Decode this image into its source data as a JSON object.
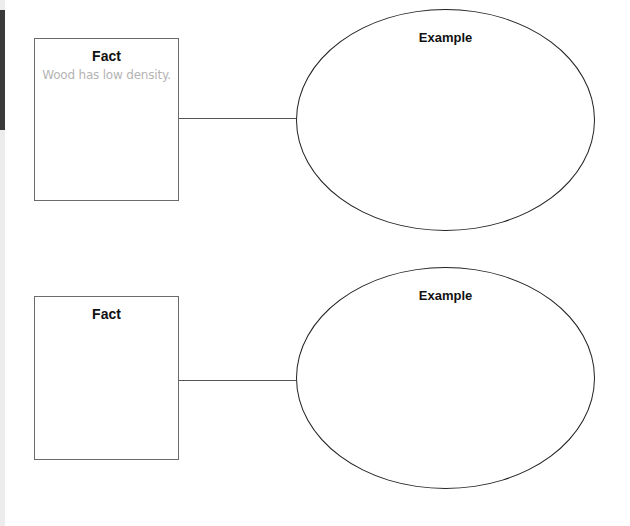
{
  "diagram": {
    "type": "fact-example organizer",
    "colors": {
      "box_border": "#6a6a6a",
      "ellipse_border": "#222222",
      "connector": "#555555",
      "title_text": "#111111",
      "sample_text": "#b4b4b4",
      "left_tab": "#3a3a3a"
    },
    "rows": [
      {
        "fact": {
          "title": "Fact",
          "text": "Wood has low density."
        },
        "example": {
          "title": "Example",
          "text": ""
        }
      },
      {
        "fact": {
          "title": "Fact",
          "text": ""
        },
        "example": {
          "title": "Example",
          "text": ""
        }
      }
    ]
  }
}
